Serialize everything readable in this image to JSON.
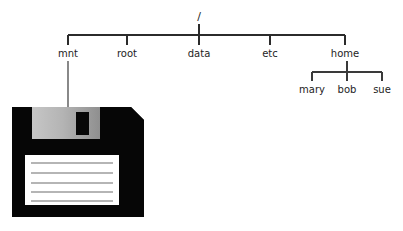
{
  "diagram": {
    "type": "tree",
    "root": {
      "label": "/",
      "x": 199,
      "y": 20
    },
    "level1_bar": {
      "y": 35,
      "x_start": 68,
      "x_end": 345
    },
    "nodes": [
      {
        "id": "mnt",
        "label": "mnt",
        "x": 68,
        "y": 56,
        "tick_y_top": 35,
        "tick_y_bottom": 44
      },
      {
        "id": "root",
        "label": "root",
        "x": 127,
        "y": 56,
        "tick_y_top": 35,
        "tick_y_bottom": 44
      },
      {
        "id": "data",
        "label": "data",
        "x": 199,
        "y": 56,
        "tick_y_top": 35,
        "tick_y_bottom": 44
      },
      {
        "id": "etc",
        "label": "etc",
        "x": 270,
        "y": 56,
        "tick_y_top": 35,
        "tick_y_bottom": 44
      },
      {
        "id": "home",
        "label": "home",
        "x": 345,
        "y": 56,
        "tick_y_top": 35,
        "tick_y_bottom": 44
      }
    ],
    "home_children_bar": {
      "y": 72,
      "x_start": 312,
      "x_end": 382,
      "parent_x": 347,
      "parent_stub_top": 60
    },
    "home_children": [
      {
        "id": "mary",
        "label": "mary",
        "x": 312,
        "y": 92
      },
      {
        "id": "bob",
        "label": "bob",
        "x": 347,
        "y": 92
      },
      {
        "id": "sue",
        "label": "sue",
        "x": 382,
        "y": 92
      }
    ],
    "mount_line": {
      "from_node": "mnt",
      "x": 68,
      "y_top": 60,
      "y_bottom": 108
    }
  },
  "floppy": {
    "name": "floppy-disk",
    "x": 12,
    "y": 107,
    "width": 132,
    "height": 110,
    "body_color": "#060606",
    "shutter_color_light": "#c2c2c2",
    "shutter_color_dark": "#9a9a9a",
    "slot_color": "#060606",
    "label_color": "#ffffff",
    "label_line_color": "#9c9c9c",
    "label_lines": 5,
    "corner_chamfer": 13
  },
  "colors": {
    "background": "#ffffff",
    "ink": "#1d1d1d",
    "edge": "#2b2b2b",
    "drop_line": "#6b6b6b"
  }
}
